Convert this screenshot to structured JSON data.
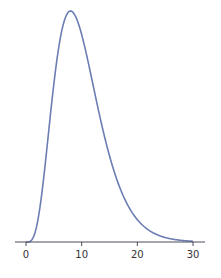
{
  "chart_data": {
    "type": "line",
    "title": "",
    "xlabel": "",
    "ylabel": "",
    "xlim": [
      -2,
      32
    ],
    "xticks": [
      0,
      10,
      20,
      30
    ],
    "tick_labels": [
      "0",
      "10",
      "20",
      "30"
    ],
    "grid": false,
    "legend": null,
    "series": [
      {
        "name": "density",
        "color": "#6b7db3",
        "x": [
          0,
          1,
          2,
          3,
          4,
          5,
          6,
          7,
          8,
          9,
          10,
          11,
          12,
          13,
          14,
          15,
          16,
          17,
          18,
          19,
          20,
          22,
          24,
          26,
          28,
          30
        ],
        "y": [
          0.0,
          0.0008,
          0.0077,
          0.0235,
          0.0451,
          0.0668,
          0.084,
          0.0941,
          0.0977,
          0.0961,
          0.0877,
          0.0783,
          0.0669,
          0.055,
          0.0443,
          0.0348,
          0.0267,
          0.0201,
          0.0149,
          0.0109,
          0.0078,
          0.004,
          0.0019,
          0.0009,
          0.0004,
          0.0002
        ]
      }
    ]
  }
}
